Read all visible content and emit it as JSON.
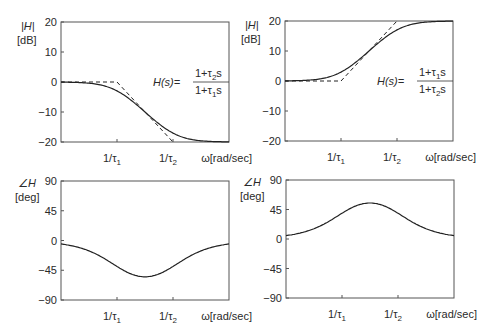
{
  "chart_data": [
    {
      "id": "top-left-magnitude",
      "type": "line",
      "title": "",
      "ylabel": "|H| [dB]",
      "xlabel": "ω[rad/sec]",
      "ylim": [
        -20,
        20
      ],
      "yticks": [
        20,
        10,
        0,
        -10,
        -20
      ],
      "xticks": [
        "1/τ1",
        "1/τ2"
      ],
      "xscale": "log",
      "formula": {
        "lhs": "H(s)=",
        "numerator": "1+τ2s",
        "denominator": "1+τ1s"
      },
      "series": [
        {
          "name": "exact",
          "style": "solid",
          "x_decades": [
            -1,
            0,
            0.5,
            1,
            2
          ],
          "values": [
            -0.04,
            -3,
            -10,
            -17,
            -20
          ]
        },
        {
          "name": "asymptote",
          "style": "dashed",
          "x_decades": [
            -1,
            0,
            1
          ],
          "values": [
            0,
            0,
            -20
          ]
        }
      ]
    },
    {
      "id": "top-right-magnitude",
      "type": "line",
      "ylabel": "|H| [dB]",
      "xlabel": "ω[rad/sec]",
      "ylim": [
        -20,
        20
      ],
      "yticks": [
        20,
        10,
        0,
        -10,
        -20
      ],
      "xticks": [
        "1/τ1",
        "1/τ2"
      ],
      "xscale": "log",
      "formula": {
        "lhs": "H(s)=",
        "numerator": "1+τ1s",
        "denominator": "1+τ2s"
      },
      "series": [
        {
          "name": "exact",
          "style": "solid",
          "x_decades": [
            -1,
            0,
            0.5,
            1,
            2
          ],
          "values": [
            0.04,
            3,
            10,
            17,
            20
          ]
        },
        {
          "name": "asymptote",
          "style": "dashed",
          "x_decades": [
            -1,
            0,
            1
          ],
          "values": [
            0,
            0,
            20
          ]
        }
      ]
    },
    {
      "id": "bottom-left-phase",
      "type": "line",
      "ylabel": "∠H [deg]",
      "xlabel": "ω[rad/sec]",
      "ylim": [
        -90,
        90
      ],
      "yticks": [
        90,
        45,
        0,
        -45,
        -90
      ],
      "xticks": [
        "1/τ1",
        "1/τ2"
      ],
      "xscale": "log",
      "series": [
        {
          "name": "phase",
          "style": "solid",
          "x_decades": [
            -1,
            0,
            0.5,
            1,
            2
          ],
          "values": [
            -5,
            -35,
            -55,
            -35,
            -5
          ]
        }
      ]
    },
    {
      "id": "bottom-right-phase",
      "type": "line",
      "ylabel": "∠H [deg]",
      "xlabel": "ω[rad/sec]",
      "ylim": [
        -90,
        90
      ],
      "yticks": [
        90,
        45,
        0,
        -45,
        -90
      ],
      "xticks": [
        "1/τ1",
        "1/τ2"
      ],
      "xscale": "log",
      "series": [
        {
          "name": "phase",
          "style": "solid",
          "x_decades": [
            -1,
            0,
            0.5,
            1,
            2
          ],
          "values": [
            5,
            35,
            55,
            35,
            5
          ]
        }
      ]
    }
  ],
  "labels": {
    "mag_axis_top": "|H|",
    "mag_axis_unit": "[dB]",
    "phase_axis_top": "∠H",
    "phase_axis_unit": "[deg]",
    "x_axis": "ω[rad/sec]",
    "tick_tau1": "1/τ",
    "tick_tau2": "1/τ",
    "sub1": "1",
    "sub2": "2",
    "hs": "H(s)=",
    "mag_ticks": [
      "20",
      "10",
      "0",
      "−10",
      "−20"
    ],
    "phase_ticks": [
      "90",
      "45",
      "0",
      "−45",
      "−90"
    ],
    "tl_num": "1+τ",
    "tl_num_sub": "2",
    "tl_den": "1+τ",
    "tl_den_sub": "1",
    "tr_num": "1+τ",
    "tr_num_sub": "1",
    "tr_den": "1+τ",
    "tr_den_sub": "2",
    "s": "s"
  }
}
